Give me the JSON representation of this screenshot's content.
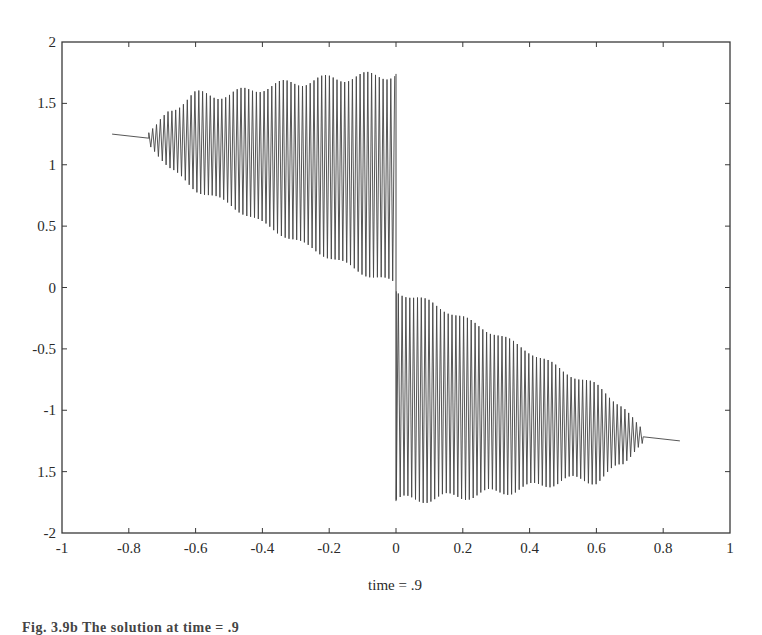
{
  "chart_data": {
    "type": "line",
    "title": "",
    "xlabel": "time = .9",
    "ylabel": "",
    "xlim": [
      -1,
      1
    ],
    "ylim": [
      -2,
      2
    ],
    "grid": false,
    "legend": null,
    "xticks": [
      -1,
      -0.8,
      -0.6,
      -0.4,
      -0.2,
      0,
      0.2,
      0.4,
      0.6,
      0.8,
      1
    ],
    "xtick_labels": [
      "-1",
      "-0.8",
      "-0.6",
      "-0.4",
      "-0.2",
      "0",
      "0.2",
      "0.4",
      "0.6",
      "0.8",
      "1"
    ],
    "yticks": [
      2,
      1.5,
      1,
      0.5,
      0,
      -0.5,
      -1,
      -1.5,
      -2
    ],
    "ytick_labels": [
      "2",
      "1.5",
      "1",
      "0.5",
      "0",
      "-0.5",
      "-1",
      "1.5",
      "-2"
    ],
    "series": [
      {
        "name": "solution",
        "description": "Odd-symmetric highly oscillatory solution; smooth for |x|>0.72, jump discontinuity at x=0",
        "x_range": [
          -0.85,
          0.85
        ],
        "envelope_left": {
          "x": [
            -0.85,
            -0.75,
            -0.72,
            -0.68,
            -0.6,
            -0.5,
            -0.4,
            -0.3,
            -0.2,
            -0.1,
            -0.02,
            0.0
          ],
          "mean": [
            1.25,
            1.22,
            1.21,
            1.19,
            1.16,
            1.12,
            1.08,
            1.04,
            1.0,
            0.92,
            0.82,
            0.8
          ],
          "upper": [
            1.25,
            1.23,
            1.28,
            1.45,
            1.57,
            1.57,
            1.63,
            1.67,
            1.7,
            1.72,
            1.73,
            1.74
          ],
          "lower": [
            1.25,
            1.2,
            1.12,
            0.97,
            0.8,
            0.68,
            0.52,
            0.38,
            0.25,
            0.12,
            0.05,
            0.03
          ]
        },
        "symmetry": "odd"
      }
    ]
  },
  "figure": {
    "caption": "Fig. 3.9b  The solution at time = .9"
  }
}
